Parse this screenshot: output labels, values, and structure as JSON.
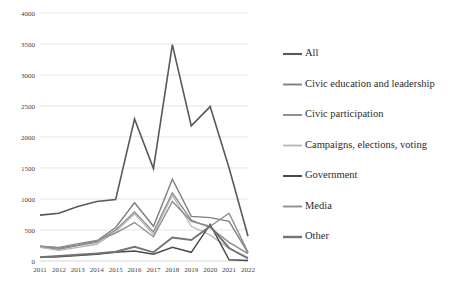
{
  "chart_data": {
    "type": "line",
    "title": "",
    "xlabel": "",
    "ylabel": "",
    "x": [
      2011,
      2012,
      2013,
      2014,
      2015,
      2016,
      2017,
      2018,
      2019,
      2020,
      2021,
      2022
    ],
    "categories": [
      "2011",
      "2012",
      "2013",
      "2014",
      "2015",
      "2016",
      "2017",
      "2018",
      "2019",
      "2020",
      "2021",
      "2022"
    ],
    "ylim": [
      0,
      4000
    ],
    "ytick_values": [
      0,
      500,
      1000,
      1500,
      2000,
      2500,
      3000,
      3500,
      4000
    ],
    "ytick_labels": [
      "0",
      "500",
      "1000",
      "1500",
      "2000",
      "2500",
      "3000",
      "3500",
      "4000"
    ],
    "grid": true,
    "legend_position": "right",
    "series": [
      {
        "name": "All",
        "color": "#595959",
        "width": 1.6,
        "values": [
          740,
          770,
          880,
          960,
          990,
          2290,
          1490,
          3490,
          2180,
          2490,
          1500,
          400
        ]
      },
      {
        "name": "Civic education and leadership",
        "color": "#7f7f7f",
        "width": 1.4,
        "values": [
          240,
          210,
          260,
          320,
          540,
          940,
          560,
          1320,
          720,
          700,
          640,
          130
        ]
      },
      {
        "name": "Civic participation",
        "color": "#8c8c8c",
        "width": 1.4,
        "values": [
          230,
          190,
          250,
          300,
          500,
          790,
          470,
          1100,
          660,
          540,
          300,
          120
        ]
      },
      {
        "name": "Campaigns, elections, voting",
        "color": "#b5b5b5",
        "width": 1.3,
        "values": [
          220,
          170,
          220,
          270,
          470,
          760,
          430,
          1060,
          560,
          420,
          200,
          60
        ]
      },
      {
        "name": "Government",
        "color": "#4a4a4a",
        "width": 1.5,
        "values": [
          60,
          70,
          90,
          110,
          140,
          160,
          110,
          220,
          140,
          590,
          20,
          10
        ]
      },
      {
        "name": "Media",
        "color": "#8f8f8f",
        "width": 1.4,
        "values": [
          240,
          220,
          280,
          330,
          450,
          620,
          390,
          960,
          640,
          560,
          770,
          140
        ]
      },
      {
        "name": "Other",
        "color": "#737373",
        "width": 1.9,
        "values": [
          60,
          80,
          100,
          120,
          150,
          230,
          140,
          380,
          340,
          560,
          210,
          40
        ]
      }
    ]
  },
  "legend": {
    "items": [
      {
        "label": "All"
      },
      {
        "label": "Civic education and leadership"
      },
      {
        "label": "Civic participation"
      },
      {
        "label": "Campaigns, elections, voting"
      },
      {
        "label": "Government"
      },
      {
        "label": "Media"
      },
      {
        "label": "Other"
      }
    ]
  }
}
